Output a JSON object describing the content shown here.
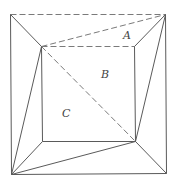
{
  "diagram": {
    "type": "geometry-square-dissection",
    "points": {
      "outer_tl": [
        10,
        14
      ],
      "outer_tr": [
        165,
        14
      ],
      "outer_bl": [
        11,
        174
      ],
      "outer_br": [
        166,
        173
      ],
      "inner_tl": [
        41,
        46
      ],
      "inner_tr": [
        134,
        46
      ],
      "inner_bl": [
        42,
        141
      ],
      "inner_br": [
        135,
        141
      ]
    },
    "segments": [
      {
        "from": "outer_tl",
        "to": "outer_tr",
        "style": "dashed"
      },
      {
        "from": "outer_tl",
        "to": "outer_bl",
        "style": "solid"
      },
      {
        "from": "outer_tr",
        "to": "outer_br",
        "style": "solid"
      },
      {
        "from": "outer_bl",
        "to": "outer_br",
        "style": "solid"
      },
      {
        "from": "inner_tl",
        "to": "inner_tr",
        "style": "dashed"
      },
      {
        "from": "inner_tl",
        "to": "inner_bl",
        "style": "solid"
      },
      {
        "from": "inner_tr",
        "to": "inner_br",
        "style": "solid"
      },
      {
        "from": "inner_bl",
        "to": "inner_br",
        "style": "solid"
      },
      {
        "from": "outer_tl",
        "to": "inner_tl",
        "style": "solid"
      },
      {
        "from": "outer_tr",
        "to": "inner_tr",
        "style": "solid"
      },
      {
        "from": "outer_bl",
        "to": "inner_bl",
        "style": "solid"
      },
      {
        "from": "outer_br",
        "to": "inner_br",
        "style": "solid"
      },
      {
        "from": "inner_tl",
        "to": "outer_tr",
        "style": "dashed"
      },
      {
        "from": "inner_tl",
        "to": "inner_br",
        "style": "dashed"
      },
      {
        "from": "inner_tl",
        "to": "outer_bl",
        "style": "solid"
      },
      {
        "from": "inner_br",
        "to": "outer_tr",
        "style": "solid"
      },
      {
        "from": "inner_br",
        "to": "outer_bl",
        "style": "solid"
      }
    ],
    "labels": [
      {
        "text": "A",
        "x": 123,
        "y": 39
      },
      {
        "text": "B",
        "x": 101,
        "y": 78
      },
      {
        "text": "C",
        "x": 62,
        "y": 117
      }
    ]
  }
}
